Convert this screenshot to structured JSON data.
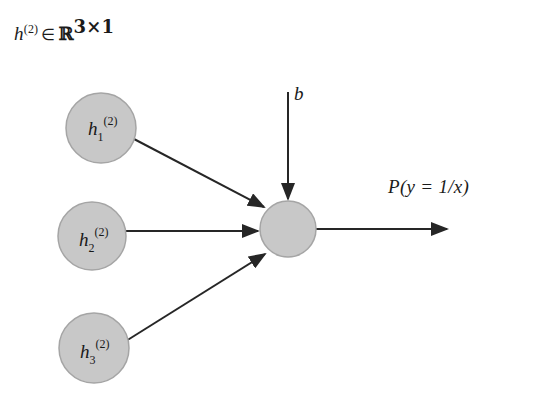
{
  "figure": {
    "title": {
      "variable": "h",
      "superscript": "(2)",
      "membership": "∈",
      "set": "ℝ",
      "set_superscript": "3×1",
      "full_text": "h(2) ∈ ℝ3×1"
    },
    "background_color": "#ffffff",
    "node_fill_color": "#c8c8c8",
    "node_stroke_color": "#9a9a9a",
    "edge_color": "#262626"
  },
  "input_nodes": [
    {
      "id": "h1",
      "base": "h",
      "subscript": "1",
      "superscript": "(2)",
      "cx": 101,
      "cy": 128,
      "r": 35
    },
    {
      "id": "h2",
      "base": "h",
      "subscript": "2",
      "superscript": "(2)",
      "cx": 92,
      "cy": 236,
      "r": 34
    },
    {
      "id": "h3",
      "base": "h",
      "subscript": "3",
      "superscript": "(2)",
      "cx": 94,
      "cy": 348,
      "r": 35
    }
  ],
  "output_node": {
    "id": "output-unit",
    "label": "",
    "cx": 288,
    "cy": 229,
    "r": 28
  },
  "bias": {
    "label": "b",
    "arrow_from": {
      "x": 288,
      "y": 92
    },
    "arrow_to": {
      "x": 288,
      "y": 199
    }
  },
  "output": {
    "label": "P(y = 1/x)",
    "arrow_from": {
      "x": 316,
      "y": 229
    },
    "arrow_to": {
      "x": 447,
      "y": 229
    }
  },
  "edges": [
    {
      "from": "h1",
      "to": "output-unit",
      "x1": 134,
      "y1": 139,
      "x2": 264,
      "y2": 207
    },
    {
      "from": "h2",
      "to": "output-unit",
      "x1": 126,
      "y1": 231,
      "x2": 258,
      "y2": 231
    },
    {
      "from": "h3",
      "to": "output-unit",
      "x1": 126,
      "y1": 341,
      "x2": 265,
      "y2": 254
    }
  ]
}
